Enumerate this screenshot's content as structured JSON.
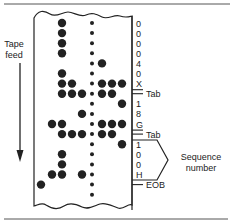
{
  "diagram": {
    "feed_label_line1": "Tape",
    "feed_label_line2": "feed",
    "characters": [
      "0",
      "0",
      "0",
      "0",
      "4",
      "0",
      "X",
      "Tab",
      "1",
      "8",
      "G",
      "Tab",
      "1",
      "0",
      "0",
      "H",
      "EOB",
      ""
    ],
    "row_holes": [
      [
        3
      ],
      [
        3
      ],
      [
        3
      ],
      [
        3
      ],
      [
        6
      ],
      [
        3
      ],
      [
        3,
        4,
        6,
        7,
        8
      ],
      [
        3,
        4,
        5,
        6,
        7
      ],
      [
        8
      ],
      [
        5
      ],
      [
        2,
        3,
        6,
        7,
        8
      ],
      [
        3,
        4,
        5,
        6,
        7
      ],
      [
        8
      ],
      [
        3
      ],
      [
        3
      ],
      [
        2,
        3,
        5
      ],
      [
        1
      ],
      []
    ],
    "sequence_label_line1": "Sequence",
    "sequence_label_line2": "number",
    "colors": {
      "ink": "#222222",
      "paper": "#ffffff"
    }
  }
}
